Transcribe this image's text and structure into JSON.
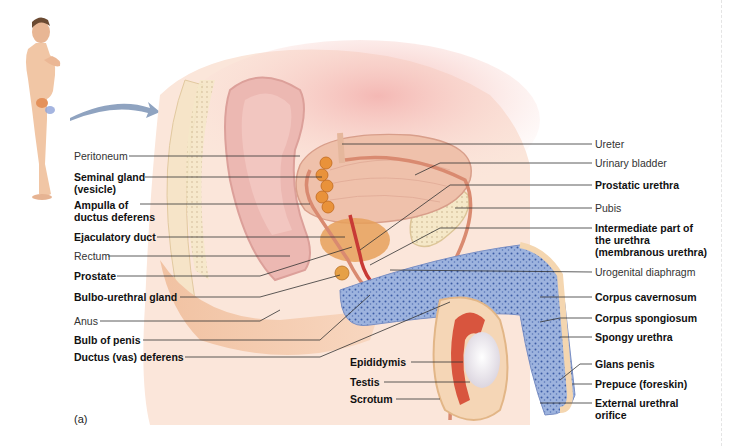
{
  "figure": {
    "panel_label": "(a)",
    "colors": {
      "skin": "#f4c9a8",
      "skin_light": "#fbe3d2",
      "peritoneal_pink": "#f0b9b6",
      "bladder": "#eebca6",
      "seminal_gland": "#e9923a",
      "prostate": "#e8a762",
      "urethra_red": "#c83a35",
      "erectile_blue": "#8fa9d8",
      "erectile_dots": "#3a5ba8",
      "bone": "#f3e3bd",
      "testis": "#f2eef2",
      "epididymis": "#d8553e",
      "arrow": "#8fa3c0",
      "leader": "#333333"
    },
    "left_labels": [
      {
        "text": "Peritoneum",
        "weight": "light"
      },
      {
        "text": "Seminal gland",
        "weight": "bold"
      },
      {
        "text": "(vesicle)",
        "weight": "bold"
      },
      {
        "text": "Ampulla of",
        "weight": "bold"
      },
      {
        "text": "ductus deferens",
        "weight": "bold"
      },
      {
        "text": "Ejaculatory duct",
        "weight": "bold"
      },
      {
        "text": "Rectum",
        "weight": "light"
      },
      {
        "text": "Prostate",
        "weight": "bold"
      },
      {
        "text": "Bulbo-urethral gland",
        "weight": "bold"
      },
      {
        "text": "Anus",
        "weight": "light"
      },
      {
        "text": "Bulb of penis",
        "weight": "bold"
      },
      {
        "text": "Ductus (vas) deferens",
        "weight": "bold"
      }
    ],
    "right_labels": [
      {
        "text": "Ureter",
        "weight": "light"
      },
      {
        "text": "Urinary bladder",
        "weight": "light"
      },
      {
        "text": "Prostatic urethra",
        "weight": "bold"
      },
      {
        "text": "Pubis",
        "weight": "light"
      },
      {
        "text": "Intermediate part of",
        "weight": "bold"
      },
      {
        "text": "the urethra",
        "weight": "bold"
      },
      {
        "text": "(membranous urethra)",
        "weight": "bold"
      },
      {
        "text": "Urogenital diaphragm",
        "weight": "light"
      },
      {
        "text": "Corpus cavernosum",
        "weight": "bold"
      },
      {
        "text": "Corpus spongiosum",
        "weight": "bold"
      },
      {
        "text": "Spongy urethra",
        "weight": "bold"
      },
      {
        "text": "Glans penis",
        "weight": "bold"
      },
      {
        "text": "Prepuce (foreskin)",
        "weight": "bold"
      },
      {
        "text": "External urethral",
        "weight": "bold"
      },
      {
        "text": "orifice",
        "weight": "bold"
      }
    ],
    "bottom_labels": [
      {
        "text": "Epididymis",
        "weight": "bold"
      },
      {
        "text": "Testis",
        "weight": "bold"
      },
      {
        "text": "Scrotum",
        "weight": "bold"
      }
    ]
  }
}
